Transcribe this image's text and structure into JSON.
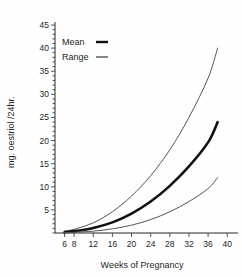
{
  "chart_data": {
    "type": "line",
    "title": "",
    "xlabel": "Weeks of Pregnancy",
    "ylabel": "mg. oestriol /24hr.",
    "xlim": [
      4,
      41
    ],
    "ylim": [
      0,
      45
    ],
    "grid": false,
    "legend_position": "top-left",
    "xticks": [
      6,
      8,
      12,
      16,
      20,
      24,
      28,
      32,
      36,
      40
    ],
    "xtick_labels": [
      "6",
      "8",
      "12",
      "16",
      "20",
      "24",
      "28",
      "32",
      "36",
      "40"
    ],
    "yticks": [
      5,
      10,
      15,
      20,
      25,
      30,
      35,
      40,
      45
    ],
    "ytick_labels": [
      "5",
      "10",
      "15",
      "20",
      "25",
      "30",
      "35",
      "40",
      "45"
    ],
    "x": [
      6,
      8,
      12,
      16,
      20,
      24,
      28,
      32,
      36,
      38
    ],
    "series": [
      {
        "name": "Range upper",
        "style": "thin",
        "color": "#555555",
        "values": [
          0.4,
          0.8,
          2.2,
          4.6,
          8.0,
          12.4,
          18.0,
          25.0,
          33.5,
          40.0
        ]
      },
      {
        "name": "Mean",
        "style": "thick",
        "color": "#111111",
        "values": [
          0.2,
          0.4,
          1.1,
          2.3,
          4.2,
          6.8,
          10.2,
          14.4,
          19.6,
          24.0
        ]
      },
      {
        "name": "Range lower",
        "style": "thin",
        "color": "#555555",
        "values": [
          0.1,
          0.15,
          0.4,
          0.9,
          1.7,
          2.9,
          4.6,
          6.8,
          9.6,
          12.0
        ]
      }
    ]
  },
  "legend": {
    "items": [
      {
        "label": "Mean",
        "marker": "thick-line-marker"
      },
      {
        "label": "Range",
        "marker": "thin-line-marker"
      }
    ]
  },
  "axes": {
    "y_title": "mg. oestriol /24hr.",
    "x_title": "Weeks of Pregnancy"
  }
}
